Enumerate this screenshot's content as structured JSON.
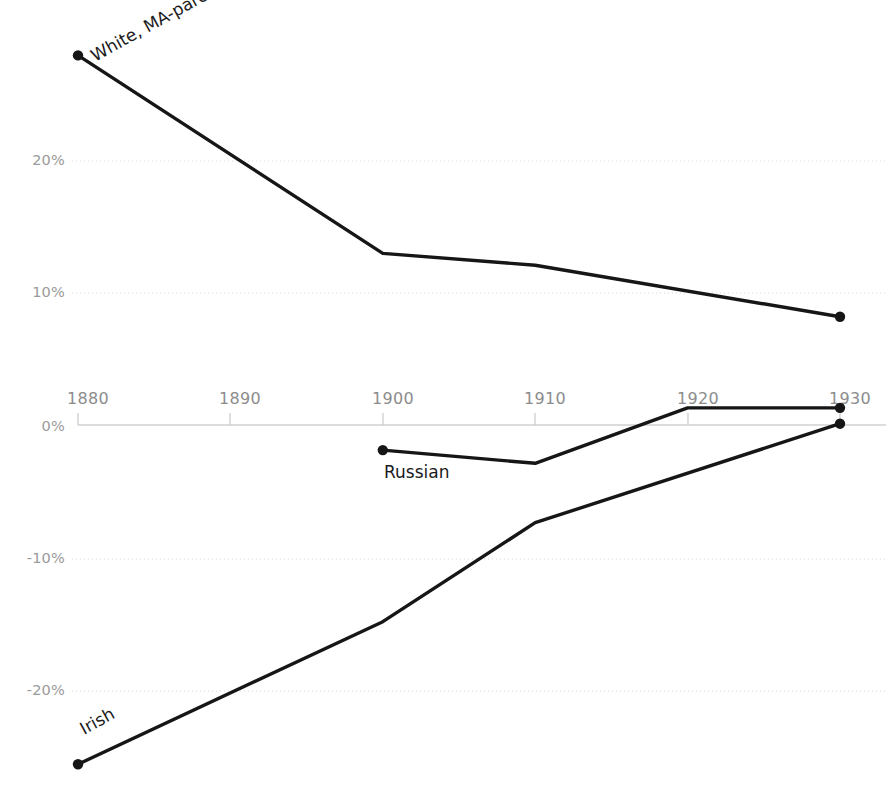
{
  "chart_data": {
    "type": "line",
    "title": "",
    "subtitle": "",
    "xlabel": "",
    "ylabel": "",
    "xlim": [
      1880,
      1930
    ],
    "ylim": [
      -27,
      29
    ],
    "grid": true,
    "legend_position": "inline-labels",
    "x": [
      1880,
      1890,
      1900,
      1910,
      1920,
      1930
    ],
    "xtick_labels": [
      "1880",
      "1890",
      "1900",
      "1910",
      "1920",
      "1930"
    ],
    "ytick_values": [
      20,
      10,
      0,
      -10,
      -20
    ],
    "ytick_labels": [
      "20%",
      "10%",
      "0%",
      "-10%",
      "-20%"
    ],
    "value_format": "percent",
    "series": [
      {
        "name": "White, MA-parentage",
        "label": "White, MA-parentage",
        "color": "#161616",
        "label_rotation": -29,
        "x": [
          1880,
          1900,
          1910,
          1930
        ],
        "values": [
          28.0,
          13.0,
          12.1,
          8.2
        ],
        "markers": [
          1880,
          1930
        ]
      },
      {
        "name": "Russian",
        "label": "Russian",
        "color": "#161616",
        "label_rotation": 0,
        "x": [
          1900,
          1910,
          1920,
          1930
        ],
        "values": [
          -1.9,
          -2.9,
          1.3,
          1.3
        ],
        "markers": [
          1900,
          1930
        ]
      },
      {
        "name": "Irish",
        "label": "Irish",
        "color": "#161616",
        "label_rotation": -29,
        "x": [
          1880,
          1900,
          1910,
          1930
        ],
        "values": [
          -25.7,
          -14.9,
          -7.4,
          0.1
        ],
        "markers": [
          1880,
          1930
        ]
      }
    ]
  },
  "axis": {
    "y_labels": [
      {
        "text": "20%",
        "value": 20
      },
      {
        "text": "10%",
        "value": 10
      },
      {
        "text": "0%",
        "value": 0
      },
      {
        "text": "-10%",
        "value": -10
      },
      {
        "text": "-20%",
        "value": -20
      }
    ],
    "x_labels": [
      {
        "text": "1880",
        "value": 1880
      },
      {
        "text": "1890",
        "value": 1890
      },
      {
        "text": "1900",
        "value": 1900
      },
      {
        "text": "1910",
        "value": 1910
      },
      {
        "text": "1920",
        "value": 1920
      },
      {
        "text": "1930",
        "value": 1930
      }
    ]
  },
  "labels": {
    "white": "White, MA-parentage",
    "russian": "Russian",
    "irish": "Irish"
  },
  "colors": {
    "line": "#161616",
    "gridline": "#d8d8d8",
    "axis": "#d0d0d0",
    "tick_text": "#8c8c8c",
    "label_text": "#1b1b1b",
    "background": "#ffffff"
  }
}
